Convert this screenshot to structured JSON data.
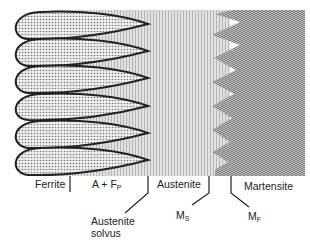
{
  "diagram": {
    "regions": [
      {
        "id": "ferrite",
        "label": "Ferrite"
      },
      {
        "id": "a_plus_fp",
        "label": "A + F",
        "subscript": "P"
      },
      {
        "id": "austenite",
        "label": "Austenite"
      },
      {
        "id": "martensite",
        "label": "Martensite"
      }
    ],
    "boundaries": [
      {
        "id": "austenite_solvus",
        "line1": "Austenite",
        "line2": "solvus"
      },
      {
        "id": "ms",
        "label": "M",
        "subscript": "S"
      },
      {
        "id": "mf",
        "label": "M",
        "subscript": "F"
      }
    ],
    "grain_count": 6,
    "colors": {
      "outline": "#222222",
      "ferrite_fill": "#d8d8d8",
      "austenite_fill": "#cfcfcf",
      "martensite_fill": "#9a9a9a"
    }
  }
}
